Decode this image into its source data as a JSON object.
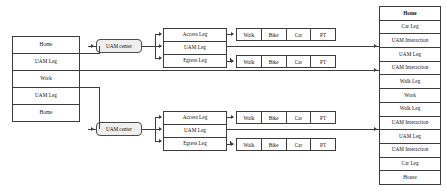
{
  "diagram": {
    "colors": {
      "line": "#3c3c3c",
      "node_fill": "#efefef",
      "box_fill": "#ffffff",
      "text": "#111111"
    },
    "trip_chain": {
      "name": "left-trip-chain-column",
      "items": [
        {
          "label": "Home"
        },
        {
          "label": "UAM Leg"
        },
        {
          "label": "Work"
        },
        {
          "label": "UAM Leg"
        },
        {
          "label": "Home"
        }
      ]
    },
    "uam_center_top": {
      "label": "UAM center"
    },
    "uam_center_bottom": {
      "label": "UAM center"
    },
    "legs_top": {
      "name": "top-leg-decomposition",
      "items": [
        {
          "label": "Access Leg"
        },
        {
          "label": "UAM Leg"
        },
        {
          "label": "Egress Leg"
        }
      ]
    },
    "legs_bottom": {
      "name": "bottom-leg-decomposition",
      "items": [
        {
          "label": "Access Leg"
        },
        {
          "label": "UAM Leg"
        },
        {
          "label": "Egress Leg"
        }
      ]
    },
    "modes_top_access": {
      "name": "top-access-mode-choices",
      "items": [
        {
          "label": "Walk"
        },
        {
          "label": "Bike"
        },
        {
          "label": "Car"
        },
        {
          "label": "PT"
        }
      ]
    },
    "modes_top_egress": {
      "name": "top-egress-mode-choices",
      "items": [
        {
          "label": "Walk"
        },
        {
          "label": "Bike"
        },
        {
          "label": "Car"
        },
        {
          "label": "PT"
        }
      ]
    },
    "modes_bottom_access": {
      "name": "bottom-access-mode-choices",
      "items": [
        {
          "label": "Walk"
        },
        {
          "label": "Bike"
        },
        {
          "label": "Car"
        },
        {
          "label": "PT"
        }
      ]
    },
    "modes_bottom_egress": {
      "name": "bottom-egress-mode-choices",
      "items": [
        {
          "label": "Walk"
        },
        {
          "label": "Bike"
        },
        {
          "label": "Car"
        },
        {
          "label": "PT"
        }
      ]
    },
    "result_chain": {
      "name": "right-resulting-trip-chain",
      "items": [
        {
          "label": "Home",
          "bold": true
        },
        {
          "label": "Car Leg",
          "bold": false
        },
        {
          "label": "UAM Interaction",
          "bold": false
        },
        {
          "label": "UAM Leg",
          "bold": false
        },
        {
          "label": "UAM Interaction",
          "bold": false
        },
        {
          "label": "Walk Leg",
          "bold": false
        },
        {
          "label": "Work",
          "bold": false
        },
        {
          "label": "Walk Leg",
          "bold": false
        },
        {
          "label": "UAM Interaction",
          "bold": false
        },
        {
          "label": "UAM Leg",
          "bold": false
        },
        {
          "label": "UAM Interaction",
          "bold": false
        },
        {
          "label": "Car Leg",
          "bold": false
        },
        {
          "label": "House",
          "bold": false
        }
      ]
    }
  }
}
